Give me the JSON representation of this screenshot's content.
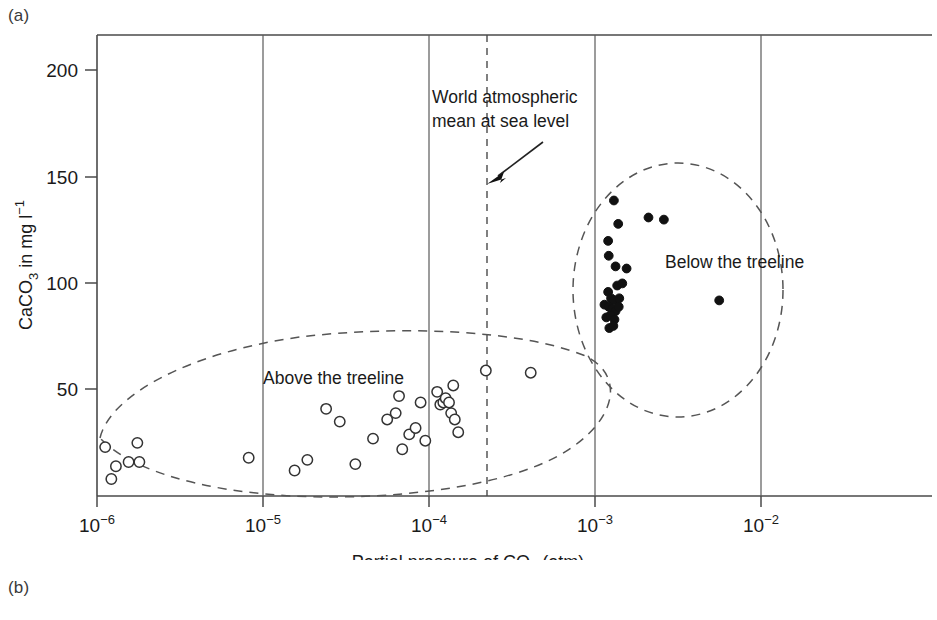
{
  "panels": {
    "a_label": "(a)",
    "b_label": "(b)"
  },
  "chart_data": {
    "type": "scatter",
    "title": "",
    "xlabel": "Partial pressure of CO2 (atm)",
    "xlabel_parts": {
      "pre": "Partial pressure of CO",
      "sub": "2",
      "post": " (atm)"
    },
    "ylabel": "CaCO3 in mg l-1",
    "ylabel_parts": {
      "pre": "CaCO",
      "sub": "3",
      "mid": " in mg l",
      "sup": "−1"
    },
    "xscale": "log",
    "xlim": [
      1e-06,
      0.031
    ],
    "ylim": [
      0,
      215
    ],
    "x_tick_labels": [
      "10−6",
      "10−5",
      "10−4",
      "10−3",
      "10−2"
    ],
    "x_tick_mantissa": "10",
    "x_tick_exponents": [
      "−6",
      "−5",
      "−4",
      "−3",
      "−2"
    ],
    "x_tick_values": [
      1e-06,
      1e-05,
      0.0001,
      0.001,
      0.01
    ],
    "y_tick_labels": [
      "50",
      "100",
      "150",
      "200"
    ],
    "y_tick_values": [
      50,
      100,
      150,
      200
    ],
    "grid": "vertical-at-decades",
    "legend": "none",
    "annotations": [
      {
        "name": "world-mean-label",
        "text_line1": "World atmospheric",
        "text_line2": "mean at sea level",
        "x": 0.00022,
        "y": 170
      },
      {
        "name": "above-treeline-label",
        "text": "Above the treeline",
        "x": 3.2e-05,
        "y": 55
      },
      {
        "name": "below-treeline-label",
        "text": "Below the treeline",
        "x": 0.0024,
        "y": 103
      }
    ],
    "reference_lines": [
      {
        "name": "world-atmospheric-mean",
        "orientation": "vertical",
        "x": 0.00022,
        "style": "dashed"
      }
    ],
    "series": [
      {
        "name": "Above the treeline",
        "marker": "open-circle",
        "color": "#ffffff",
        "edge_color": "#333333",
        "points": [
          [
            1.12e-06,
            23
          ],
          [
            1.3e-06,
            14
          ],
          [
            1.22e-06,
            8
          ],
          [
            1.55e-06,
            16
          ],
          [
            1.75e-06,
            25
          ],
          [
            1.8e-06,
            16
          ],
          [
            8.2e-06,
            18
          ],
          [
            1.55e-05,
            12
          ],
          [
            1.85e-05,
            17
          ],
          [
            2.4e-05,
            41
          ],
          [
            2.9e-05,
            35
          ],
          [
            3.6e-05,
            15
          ],
          [
            4.6e-05,
            27
          ],
          [
            5.6e-05,
            36
          ],
          [
            6.3e-05,
            39
          ],
          [
            6.6e-05,
            47
          ],
          [
            6.9e-05,
            22
          ],
          [
            7.6e-05,
            29
          ],
          [
            8.3e-05,
            32
          ],
          [
            8.9e-05,
            44
          ],
          [
            9.5e-05,
            26
          ],
          [
            0.000112,
            49
          ],
          [
            0.000117,
            43
          ],
          [
            0.000122,
            44
          ],
          [
            0.000126,
            46
          ],
          [
            0.000132,
            44
          ],
          [
            0.000136,
            39
          ],
          [
            0.00014,
            52
          ],
          [
            0.000143,
            36
          ],
          [
            0.00015,
            30
          ],
          [
            0.00022,
            59
          ],
          [
            0.00041,
            58
          ]
        ]
      },
      {
        "name": "Below the treeline",
        "marker": "filled-circle",
        "color": "#111111",
        "edge_color": "#111111",
        "points": [
          [
            0.0013,
            139
          ],
          [
            0.00138,
            128
          ],
          [
            0.0012,
            120
          ],
          [
            0.00121,
            113
          ],
          [
            0.0021,
            131
          ],
          [
            0.0026,
            130
          ],
          [
            0.00133,
            108
          ],
          [
            0.00155,
            107
          ],
          [
            0.0012,
            96
          ],
          [
            0.00136,
            99
          ],
          [
            0.00146,
            100
          ],
          [
            0.00125,
            93
          ],
          [
            0.0013,
            92
          ],
          [
            0.0014,
            93
          ],
          [
            0.00114,
            90
          ],
          [
            0.00121,
            89
          ],
          [
            0.00127,
            88
          ],
          [
            0.00133,
            87
          ],
          [
            0.00139,
            89
          ],
          [
            0.00117,
            84
          ],
          [
            0.00124,
            85
          ],
          [
            0.00131,
            83
          ],
          [
            0.00122,
            79
          ],
          [
            0.00129,
            80
          ],
          [
            0.0056,
            92
          ]
        ]
      }
    ]
  }
}
